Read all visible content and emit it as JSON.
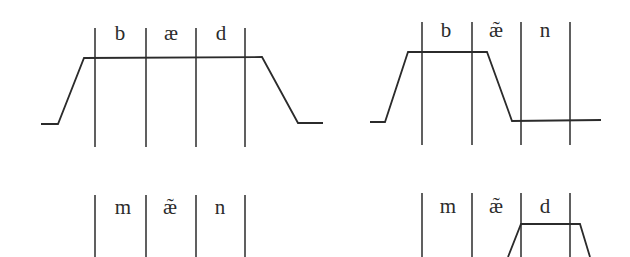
{
  "panels": [
    {
      "id": "top-left",
      "segments": [
        "b",
        "æ",
        "d"
      ],
      "boundaries_x": [
        95,
        146,
        196,
        245
      ],
      "boundary_y": [
        28,
        147
      ],
      "label_y": 40,
      "velum_contour": [
        [
          41,
          124
        ],
        [
          58,
          124
        ],
        [
          84,
          58
        ],
        [
          262,
          57
        ],
        [
          298,
          123
        ],
        [
          323,
          123
        ]
      ]
    },
    {
      "id": "top-right",
      "segments": [
        "b",
        "æ̃",
        "n"
      ],
      "boundaries_x": [
        422,
        472,
        521,
        570
      ],
      "boundary_y": [
        22,
        145
      ],
      "label_y": 37,
      "velum_contour": [
        [
          370,
          122
        ],
        [
          385,
          122
        ],
        [
          408,
          52
        ],
        [
          487,
          52
        ],
        [
          512,
          121
        ],
        [
          601,
          120
        ]
      ]
    },
    {
      "id": "bottom-left",
      "segments": [
        "m",
        "æ̃",
        "n"
      ],
      "boundaries_x": [
        95,
        146,
        196,
        245
      ],
      "boundary_y": [
        195,
        257
      ],
      "label_y": 214,
      "velum_contour": []
    },
    {
      "id": "bottom-right",
      "segments": [
        "m",
        "æ̃",
        "d"
      ],
      "boundaries_x": [
        422,
        472,
        521,
        570
      ],
      "boundary_y": [
        193,
        257
      ],
      "label_y": 213,
      "velum_contour": [
        [
          508,
          257
        ],
        [
          521,
          224
        ],
        [
          580,
          224
        ],
        [
          590,
          257
        ]
      ]
    }
  ],
  "colors": {
    "ink": "#2b2b2b",
    "background": "#ffffff"
  }
}
